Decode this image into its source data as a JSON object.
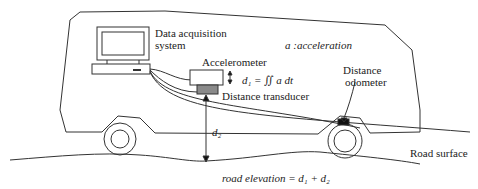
{
  "diagram": {
    "labels": {
      "data_acquisition_line1": "Data acquisition",
      "data_acquisition_line2": "system",
      "accelerometer": "Accelerometer",
      "acceleration_def": "a :acceleration",
      "d1_formula": "d₁ = ∬ a dt",
      "distance_transducer": "Distance transducer",
      "distance_odometer_line1": "Distance",
      "distance_odometer_line2": "odometer",
      "d2": "d₂",
      "road_surface": "Road surface",
      "road_elevation": "road elevation = d₁ + d₂"
    },
    "colors": {
      "line": "#333333",
      "transducer_fill": "#8a8a8a",
      "odometer_fill": "#111111"
    }
  }
}
